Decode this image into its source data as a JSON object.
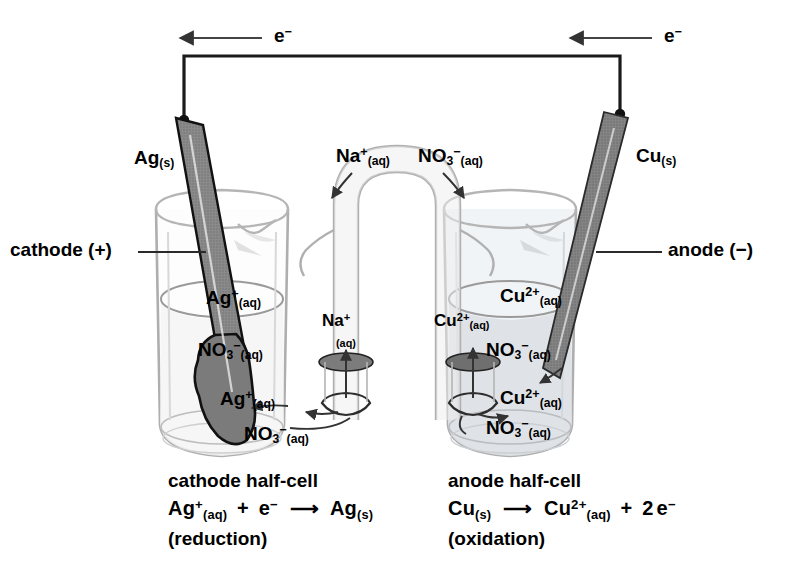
{
  "diagram": {
    "type": "electrochemical-cell-diagram"
  },
  "colors": {
    "background": "#ffffff",
    "wire": "#1a1a1a",
    "glass_outline": "#a8a8a8",
    "ag_electrode": "#787878",
    "cu_electrode": "#6e6e6e",
    "ag_solution": "#ffffff",
    "cu_solution": "#dfe3e6",
    "arrow": "#333333",
    "text": "#000000"
  },
  "circuit": {
    "electron_label_left": "e",
    "electron_label_left_charge": "−",
    "electron_label_right": "e",
    "electron_label_right_charge": "−",
    "wire_description": "external wire connecting Ag and Cu electrodes"
  },
  "electrodes": {
    "left": {
      "name": "Ag",
      "state": "(s)",
      "side_label": "cathode (+)"
    },
    "right": {
      "name": "Cu",
      "state": "(s)",
      "side_label": "anode (−)"
    }
  },
  "salt_bridge": {
    "left_ion": "Na",
    "left_ion_charge": "+",
    "left_ion_state": "(aq)",
    "right_ion": "NO",
    "right_ion_sub": "3",
    "right_ion_charge": "−",
    "right_ion_state": "(aq)"
  },
  "left_beaker_species": [
    {
      "symbol": "Ag",
      "charge": "+",
      "sub": "",
      "state": "(aq)"
    },
    {
      "symbol": "NO",
      "charge": "−",
      "sub": "3",
      "state": "(aq)"
    },
    {
      "symbol": "Ag",
      "charge": "+",
      "sub": "",
      "state": "(aq)"
    },
    {
      "symbol": "NO",
      "charge": "−",
      "sub": "3",
      "state": "(aq)"
    },
    {
      "symbol": "Na",
      "charge": "+",
      "sub": "",
      "state": "(aq)"
    }
  ],
  "right_beaker_species": [
    {
      "symbol": "Cu",
      "charge": "2+",
      "sub": "",
      "state": "(aq)"
    },
    {
      "symbol": "Cu",
      "charge": "2+",
      "sub": "",
      "state": "(aq)"
    },
    {
      "symbol": "NO",
      "charge": "−",
      "sub": "3",
      "state": "(aq)"
    },
    {
      "symbol": "Cu",
      "charge": "2+",
      "sub": "",
      "state": "(aq)"
    },
    {
      "symbol": "NO",
      "charge": "−",
      "sub": "3",
      "state": "(aq)"
    }
  ],
  "captions": {
    "left": {
      "heading": "cathode half-cell",
      "equation_parts": {
        "reactant": "Ag",
        "reactant_charge": "+",
        "reactant_state": "(aq)",
        "plus": "+",
        "electron": "e",
        "electron_charge": "−",
        "arrow": "⟶",
        "product": "Ag",
        "product_state": "(s)"
      },
      "note": "(reduction)"
    },
    "right": {
      "heading": "anode half-cell",
      "equation_parts": {
        "reactant": "Cu",
        "reactant_state": "(s)",
        "arrow": "⟶",
        "product": "Cu",
        "product_charge": "2+",
        "product_state": "(aq)",
        "plus": "+",
        "coefficient": "2",
        "electron": "e",
        "electron_charge": "−"
      },
      "note": "(oxidation)"
    }
  }
}
